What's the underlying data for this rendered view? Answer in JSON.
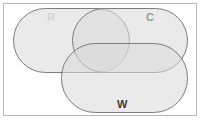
{
  "figure": {
    "type": "venn-diagram",
    "set_count": 3,
    "background_color": "#ffffff",
    "frame_color": "#b9b9b9",
    "stroke_color": "#6f6f6f",
    "fill_color": "#d8d8d8",
    "fill_opacity": 0.55
  },
  "chart_data": {
    "type": "venn",
    "title": "",
    "sets": [
      {
        "id": "R",
        "label": "R",
        "shape": "stadium",
        "label_color": "#d4d4d4",
        "x": 13,
        "y": 8,
        "width": 117,
        "height": 65,
        "label_x": 47,
        "label_y": 12
      },
      {
        "id": "C",
        "label": "C",
        "shape": "stadium",
        "label_color": "#9b9b9b",
        "x": 72,
        "y": 8,
        "width": 116,
        "height": 65,
        "label_x": 146,
        "label_y": 12
      },
      {
        "id": "W",
        "label": "W",
        "shape": "stadium",
        "label_color": "#3c3c3c",
        "x": 61,
        "y": 43,
        "width": 127,
        "height": 70,
        "label_x": 117,
        "label_y": 99
      }
    ],
    "regions": [
      "R only",
      "C only",
      "W only",
      "R ∩ C",
      "R ∩ W",
      "C ∩ W",
      "R ∩ C ∩ W"
    ],
    "legend": "none",
    "grid": false
  },
  "labels": {
    "r": "R",
    "c": "C",
    "w": "W"
  }
}
